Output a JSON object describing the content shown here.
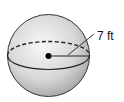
{
  "diagram": {
    "type": "sphere",
    "radius_label": "7 ft",
    "shape": {
      "cx": 48.5,
      "cy": 55.5,
      "r": 41
    },
    "equator": {
      "rx": 41,
      "ry": 14
    },
    "colors": {
      "fill_light": "#f4f4f4",
      "fill_dark": "#a8a8a8",
      "stroke": "#222222"
    }
  }
}
